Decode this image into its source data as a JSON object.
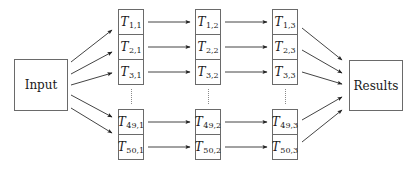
{
  "diagram": {
    "input": {
      "label": "Input"
    },
    "results": {
      "label": "Results"
    },
    "columns": [
      {
        "index": 1,
        "cells": [
          {
            "base": "T",
            "sub": "1,1"
          },
          {
            "base": "T",
            "sub": "2,1"
          },
          {
            "base": "T",
            "sub": "3,1"
          },
          {
            "base": "T",
            "sub": "49,1"
          },
          {
            "base": "T",
            "sub": "50,1"
          }
        ]
      },
      {
        "index": 2,
        "cells": [
          {
            "base": "T",
            "sub": "1,2"
          },
          {
            "base": "T",
            "sub": "2,2"
          },
          {
            "base": "T",
            "sub": "3,2"
          },
          {
            "base": "T",
            "sub": "49,2"
          },
          {
            "base": "T",
            "sub": "50,2"
          }
        ]
      },
      {
        "index": 3,
        "cells": [
          {
            "base": "T",
            "sub": "1,3"
          },
          {
            "base": "T",
            "sub": "2,3"
          },
          {
            "base": "T",
            "sub": "3,3"
          },
          {
            "base": "T",
            "sub": "49,3"
          },
          {
            "base": "T",
            "sub": "50,3"
          }
        ]
      }
    ],
    "ellipsis": "vertical-dots",
    "colors": {
      "line": "#6a6a6a",
      "arrow": "#333333",
      "text": "#1a1a1a"
    }
  }
}
